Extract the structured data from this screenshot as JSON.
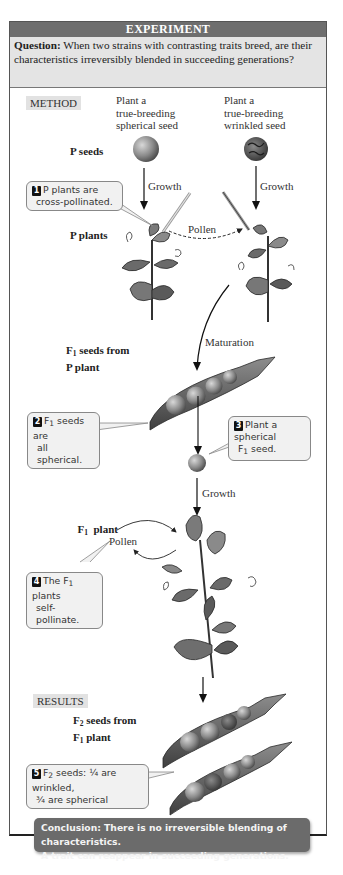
{
  "header": {
    "title": "EXPERIMENT",
    "question_label": "Question:",
    "question_text": " When two strains with contrasting traits breed, are their characteristics irreversibly blended in succeeding generations?"
  },
  "sections": {
    "method": "METHOD",
    "results": "RESULTS"
  },
  "columns": {
    "left_line1": "Plant a",
    "left_line2": "true-breeding",
    "left_line3": "spherical seed",
    "right_line1": "Plant a",
    "right_line2": "true-breeding",
    "right_line3": "wrinkled seed"
  },
  "stage_labels": {
    "p_seeds": "P seeds",
    "p_plants": "P plants",
    "f1_seeds_prefix": "F",
    "f1_seeds_sub": "1",
    "f1_seeds_rest": " seeds from",
    "f1_seeds_line2": "P plant",
    "f1_plant_prefix": "F",
    "f1_plant_sub": "1",
    "f1_plant_rest": "  plant",
    "f2_seeds_prefix": "F",
    "f2_seeds_sub": "2",
    "f2_seeds_rest": " seeds from",
    "f2_seeds_line2_prefix": "F",
    "f2_seeds_line2_sub": "1",
    "f2_seeds_line2_rest": " plant"
  },
  "arrow_labels": {
    "growth_left": "Growth",
    "growth_right": "Growth",
    "pollen_cross": "Pollen",
    "maturation": "Maturation",
    "growth_f1": "Growth",
    "pollen_self": "Pollen"
  },
  "callouts": [
    {
      "number": "1",
      "line1": "P plants are",
      "line2": "cross-pollinated."
    },
    {
      "number": "2",
      "line1_prefix": "F",
      "line1_sub": "1",
      "line1_rest": " seeds are",
      "line2": "all spherical."
    },
    {
      "number": "3",
      "line1": "Plant a spherical",
      "line2_prefix": "F",
      "line2_sub": "1",
      "line2_rest": " seed."
    },
    {
      "number": "4",
      "line1_prefix": "The F",
      "line1_sub": "1",
      "line1_rest": " plants",
      "line2": "self-pollinate."
    },
    {
      "number": "5",
      "line1_prefix": "F",
      "line1_sub": "2",
      "line1_rest": " seeds: ¼ are wrinkled,",
      "line2": "¾ are spherical"
    }
  ],
  "conclusion": {
    "line1": "Conclusion: There is no irreversible blending of characteristics.",
    "line2": "A trait can reappear in succeeding generations."
  },
  "colors": {
    "title_bar": "#6e6e6e",
    "question_bg": "#e4e4e4",
    "section_tag_bg": "#e2e2e2",
    "callout_bg": "#f1f1f1",
    "conclusion_bg": "#6b6b6b"
  }
}
